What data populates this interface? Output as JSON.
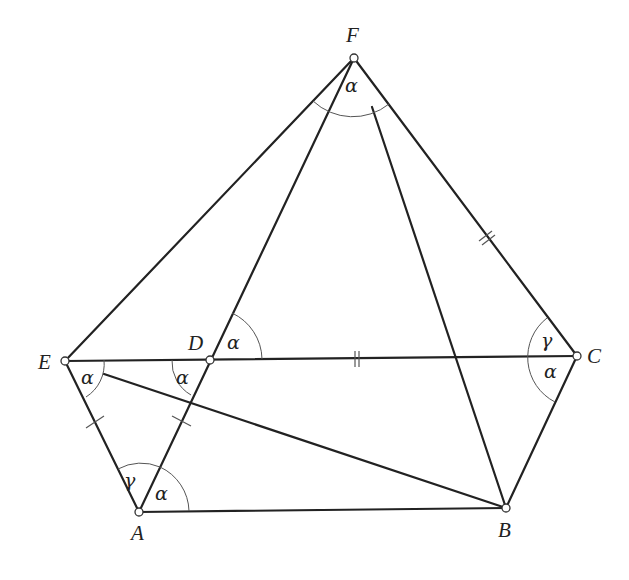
{
  "diagram": {
    "points": {
      "A": {
        "label": "A",
        "x": 139,
        "y": 512
      },
      "B": {
        "label": "B",
        "x": 506,
        "y": 508
      },
      "C": {
        "label": "C",
        "x": 577,
        "y": 356
      },
      "D": {
        "label": "D",
        "x": 210,
        "y": 360
      },
      "E": {
        "label": "E",
        "x": 65,
        "y": 361
      },
      "F": {
        "label": "F",
        "x": 354,
        "y": 58
      }
    },
    "segments": [
      "EF",
      "FC",
      "CB",
      "BA",
      "AE",
      "EC",
      "AF",
      "FB",
      "EB"
    ],
    "angles": {
      "F": "α",
      "D_upper_right": "α",
      "D_lower_left": "α",
      "E": "α",
      "A_left": "γ",
      "A_right": "α",
      "C_upper": "γ",
      "C_lower": "α"
    },
    "tick_marks": {
      "single": [
        "EA",
        "DA"
      ],
      "double": [
        "FC",
        "DC"
      ]
    }
  }
}
